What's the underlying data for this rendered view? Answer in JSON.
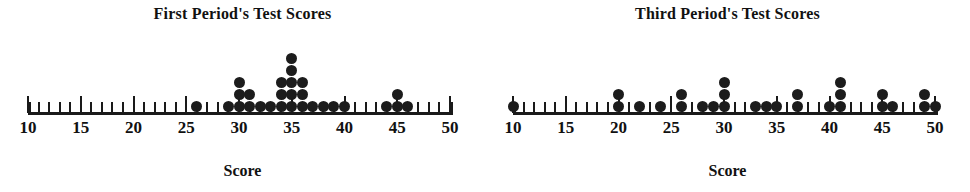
{
  "figure": {
    "axis_label": "Score",
    "dot_color": "#1c1c1c",
    "axis_color": "#1a1a1a"
  },
  "chart_data": [
    {
      "type": "scatter",
      "plot_kind": "dot-plot",
      "title": "First Period's Test Scores",
      "xlabel": "Score",
      "ylabel": "",
      "xlim": [
        10,
        50
      ],
      "xtick_step": 1,
      "major_tick_step": 5,
      "tick_labels": [
        "10",
        "15",
        "20",
        "25",
        "30",
        "35",
        "40",
        "45",
        "50"
      ],
      "tick_label_values": [
        10,
        15,
        20,
        25,
        30,
        35,
        40,
        45,
        50
      ],
      "grid": false,
      "legend": "none",
      "categories": [
        26,
        29,
        30,
        31,
        32,
        33,
        34,
        35,
        36,
        37,
        38,
        39,
        40,
        44,
        45,
        46
      ],
      "values": [
        1,
        1,
        3,
        2,
        1,
        1,
        3,
        5,
        3,
        1,
        1,
        1,
        1,
        1,
        2,
        1
      ],
      "total_dots": 28
    },
    {
      "type": "scatter",
      "plot_kind": "dot-plot",
      "title": "Third Period's Test Scores",
      "xlabel": "Score",
      "ylabel": "",
      "xlim": [
        10,
        50
      ],
      "xtick_step": 1,
      "major_tick_step": 5,
      "tick_labels": [
        "10",
        "15",
        "20",
        "25",
        "30",
        "35",
        "40",
        "45",
        "50"
      ],
      "tick_label_values": [
        10,
        15,
        20,
        25,
        30,
        35,
        40,
        45,
        50
      ],
      "grid": false,
      "legend": "none",
      "categories": [
        10,
        20,
        22,
        24,
        26,
        28,
        29,
        30,
        33,
        34,
        35,
        37,
        40,
        41,
        45,
        46,
        49,
        50
      ],
      "values": [
        1,
        2,
        1,
        1,
        2,
        1,
        1,
        3,
        1,
        1,
        1,
        2,
        1,
        3,
        2,
        1,
        2,
        1
      ],
      "total_dots": 27
    }
  ]
}
